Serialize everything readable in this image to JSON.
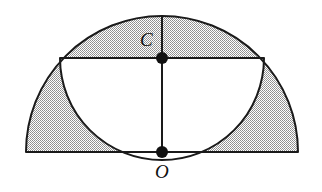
{
  "figure": {
    "type": "geometry-diagram",
    "background_color": "#ffffff",
    "stroke_color": "#1a1a1a",
    "shade_color": "#b4b4b4",
    "shade_pattern": "stipple-dots",
    "stroke_width": 2,
    "canvas": {
      "width": 322,
      "height": 192
    },
    "labels": {
      "center_top": "C",
      "center_bottom": "O"
    },
    "points": [
      {
        "name": "O",
        "label": "O",
        "x": 162,
        "y": 152,
        "radius": 6,
        "filled": true
      },
      {
        "name": "C",
        "label": "C",
        "x": 162,
        "y": 58,
        "radius": 6,
        "filled": true
      }
    ],
    "outer_semicircle": {
      "center_x": 162,
      "center_y": 152,
      "radius": 136,
      "left_x": 26,
      "right_x": 298,
      "top_y": 16,
      "orientation": "upward",
      "filled": true
    },
    "inner_semicircle": {
      "center_x": 162,
      "center_y": 58,
      "radius": 102,
      "left_x": 60,
      "right_x": 264,
      "bottom_y": 160,
      "orientation": "downward",
      "filled": false,
      "fill_color": "#ffffff"
    },
    "chord": {
      "name": "horizontal-diameter",
      "x1": 60,
      "y1": 58,
      "x2": 264,
      "y2": 58
    },
    "vertical_line": {
      "name": "vertical-axis",
      "x1": 162,
      "y1": 16,
      "x2": 162,
      "y2": 152
    },
    "baseline": {
      "name": "base-diameter",
      "x1": 26,
      "y1": 152,
      "x2": 298,
      "y2": 152
    }
  }
}
